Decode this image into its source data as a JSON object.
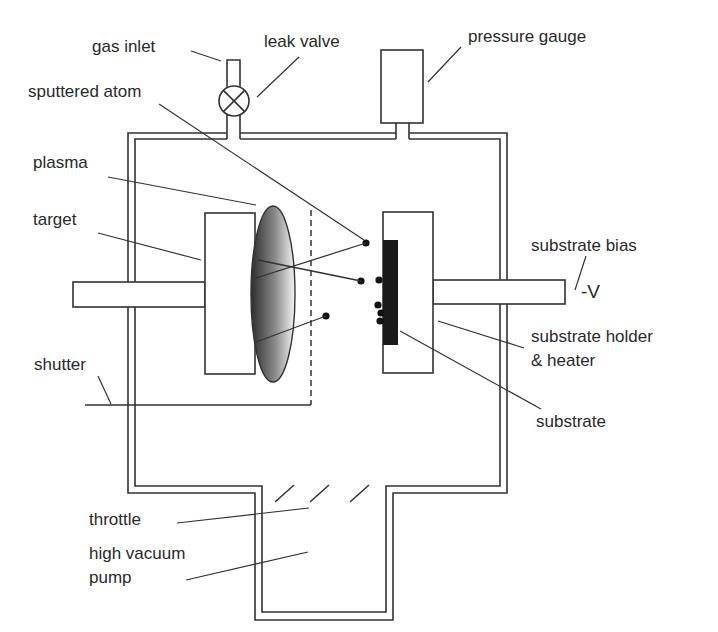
{
  "colors": {
    "line": "#333333",
    "substrate": "#1a1a1a",
    "plasma_dark": "#2e2e2e",
    "plasma_light": "#f4f4f4",
    "atom": "#111111",
    "background": "#ffffff"
  },
  "labels": {
    "gas_inlet": "gas inlet",
    "leak_valve": "leak valve",
    "pressure_gauge": "pressure gauge",
    "sputtered_atom": "sputtered atom",
    "plasma": "plasma",
    "target": "target",
    "substrate_bias": "substrate bias",
    "bias_voltage": "-V",
    "substrate_holder_line1": "substrate holder",
    "substrate_holder_line2": "& heater",
    "shutter": "shutter",
    "substrate": "substrate",
    "throttle": "throttle",
    "pump_line1": "high vacuum",
    "pump_line2": "pump"
  }
}
